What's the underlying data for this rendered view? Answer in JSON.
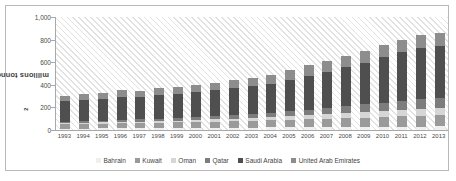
{
  "chart_data": {
    "type": "bar",
    "stacked": true,
    "title": "",
    "xlabel": "",
    "ylabel": "millions tonnes CO2",
    "ylabel_display": "millions tonnes CO",
    "ylabel_sub": "2",
    "ylim": [
      0,
      1000
    ],
    "yticks": [
      0,
      200,
      400,
      600,
      800,
      1000
    ],
    "ytick_labels": [
      "0",
      "200",
      "400",
      "600",
      "800",
      "1,000"
    ],
    "grid": false,
    "legend_position": "bottom",
    "categories": [
      "1993",
      "1994",
      "1995",
      "1996",
      "1997",
      "1998",
      "1999",
      "2000",
      "2001",
      "2002",
      "2003",
      "2004",
      "2005",
      "2006",
      "2007",
      "2008",
      "2009",
      "2010",
      "2011",
      "2012",
      "2013"
    ],
    "series": [
      {
        "name": "Bahrain",
        "color": "#efefef",
        "values": [
          12,
          13,
          14,
          15,
          16,
          17,
          18,
          19,
          20,
          21,
          22,
          23,
          24,
          25,
          26,
          27,
          28,
          29,
          30,
          31,
          32
        ]
      },
      {
        "name": "Kuwait",
        "color": "#9a9a9a",
        "values": [
          38,
          40,
          42,
          44,
          45,
          47,
          49,
          52,
          54,
          56,
          58,
          62,
          66,
          70,
          74,
          78,
          82,
          86,
          90,
          94,
          98
        ]
      },
      {
        "name": "Oman",
        "color": "#d6d6d6",
        "values": [
          10,
          11,
          12,
          13,
          14,
          15,
          16,
          18,
          20,
          22,
          24,
          27,
          30,
          34,
          38,
          42,
          46,
          52,
          56,
          60,
          64
        ]
      },
      {
        "name": "Qatar",
        "color": "#7d7d7d",
        "values": [
          14,
          15,
          16,
          18,
          19,
          21,
          23,
          26,
          29,
          32,
          35,
          40,
          46,
          52,
          58,
          64,
          70,
          76,
          82,
          88,
          92
        ]
      },
      {
        "name": "Saudi Arabia",
        "color": "#4f4f4f",
        "values": [
          180,
          190,
          192,
          198,
          200,
          210,
          215,
          225,
          232,
          240,
          248,
          258,
          275,
          300,
          320,
          345,
          370,
          400,
          430,
          450,
          455
        ]
      },
      {
        "name": "United Arab Emirates",
        "color": "#8d8d8d",
        "values": [
          46,
          52,
          54,
          62,
          56,
          60,
          58,
          62,
          64,
          68,
          72,
          78,
          88,
          92,
          94,
          98,
          104,
          108,
          110,
          118,
          120
        ]
      }
    ],
    "totals": [
      300,
      321,
      330,
      350,
      350,
      370,
      379,
      402,
      419,
      439,
      459,
      488,
      529,
      573,
      610,
      654,
      700,
      751,
      798,
      841,
      861
    ]
  },
  "accent_colors": {
    "frame_border": "#b9b9b9",
    "axis_line": "#a8a8a8",
    "hatch": "#e2e2e2",
    "text": "#4a4a4a"
  }
}
